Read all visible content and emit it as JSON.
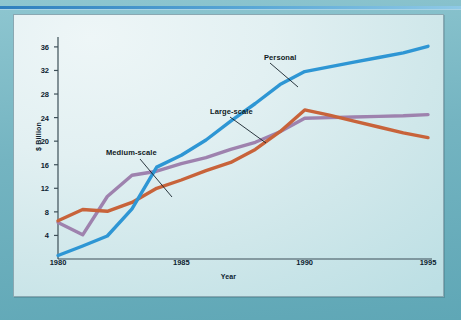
{
  "page": {
    "background_color": "#6fb3c0",
    "rule_color": "#2f7fbe",
    "panel_background": "#e2f0f2",
    "panel_border": "#8aa8b2"
  },
  "chart_data": {
    "type": "line",
    "title": "",
    "xlabel": "Year",
    "ylabel": "$ Billion",
    "xlim": [
      1980,
      1995
    ],
    "ylim": [
      0,
      37
    ],
    "grid": false,
    "legend": "annotations-on-plot",
    "x": [
      1980,
      1981,
      1982,
      1983,
      1984,
      1985,
      1986,
      1987,
      1988,
      1989,
      1990,
      1991,
      1992,
      1993,
      1994,
      1995
    ],
    "xticks": [
      "1980",
      "1985",
      "1990",
      "1995"
    ],
    "yticks": [
      "4",
      "8",
      "12",
      "16",
      "20",
      "24",
      "28",
      "32",
      "36"
    ],
    "series": [
      {
        "name": "Personal",
        "color": "#2E96D4",
        "label_x": 1988.1,
        "label_y": 35.6,
        "values": [
          0.6,
          2.2,
          3.9,
          8.5,
          15.6,
          17.6,
          20.2,
          23.4,
          26.4,
          29.6,
          31.8,
          32.6,
          33.4,
          34.2,
          35.0,
          36.1
        ]
      },
      {
        "name": "Medium-scale",
        "color": "#9E82AE",
        "label_x": 1982.1,
        "label_y": 20.6,
        "values": [
          6.2,
          4.1,
          10.6,
          14.2,
          14.9,
          16.2,
          17.2,
          18.6,
          19.8,
          21.6,
          23.9,
          24.0,
          24.1,
          24.2,
          24.3,
          24.5
        ]
      },
      {
        "name": "Large-scale",
        "color": "#C8633A",
        "label_x": 1985.9,
        "label_y": 27.4,
        "values": [
          6.5,
          8.4,
          8.1,
          9.6,
          12.0,
          13.4,
          15.0,
          16.4,
          18.6,
          21.6,
          25.3,
          24.4,
          23.4,
          22.4,
          21.4,
          20.6
        ]
      }
    ],
    "annotations": [
      {
        "text": "Personal",
        "x": 250,
        "y": 38,
        "leader": [
          [
            256,
            48
          ],
          [
            284,
            72
          ]
        ]
      },
      {
        "text": "Large-scale",
        "x": 196,
        "y": 92,
        "leader": [
          [
            216,
            102
          ],
          [
            252,
            128
          ]
        ]
      },
      {
        "text": "Medium-scale",
        "x": 92,
        "y": 133,
        "leader": [
          [
            126,
            144
          ],
          [
            158,
            182
          ]
        ]
      }
    ]
  }
}
